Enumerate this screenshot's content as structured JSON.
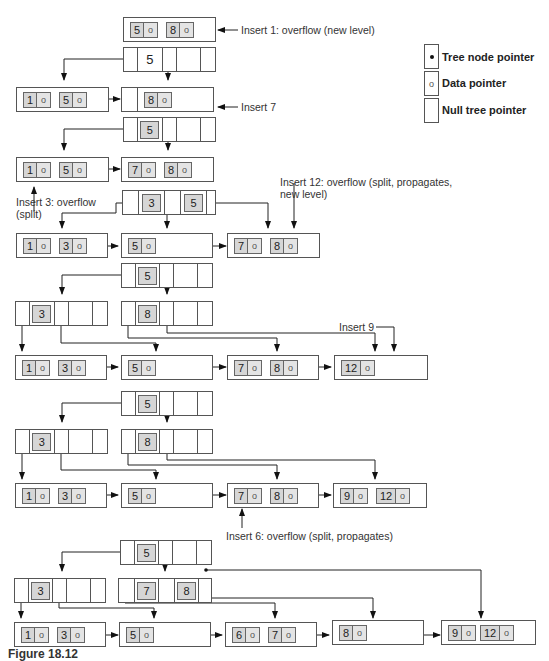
{
  "legend": {
    "items": [
      {
        "symbol": "•",
        "label": "Tree node pointer"
      },
      {
        "symbol": "o",
        "label": "Data pointer"
      },
      {
        "symbol": "",
        "label": "Null tree pointer"
      }
    ]
  },
  "annotations": {
    "insert1": "Insert 1: overflow (new level)",
    "insert7": "Insert 7",
    "insert3_line1": "Insert 3: overflow",
    "insert3_line2": "(split)",
    "insert12_line1": "Insert 12: overflow (split, propagates,",
    "insert12_line2": "new level)",
    "insert9": "Insert 9",
    "insert6": "Insert 6: overflow (split, propagates)"
  },
  "data_pointer_symbol": "o",
  "stages": {
    "s1": {
      "leaf": [
        "5",
        "8"
      ]
    },
    "s2": {
      "root": [
        "5"
      ],
      "leaves": [
        [
          "1",
          "5"
        ],
        [
          "8"
        ]
      ]
    },
    "s3": {
      "root": [
        "5"
      ],
      "leaves": [
        [
          "1",
          "5"
        ],
        [
          "7",
          "8"
        ]
      ]
    },
    "s4": {
      "root": [
        "3",
        "5"
      ],
      "leaves": [
        [
          "1",
          "3"
        ],
        [
          "5"
        ],
        [
          "7",
          "8"
        ]
      ]
    },
    "s5": {
      "root": [
        "5"
      ],
      "internal": [
        [
          "3"
        ],
        [
          "8"
        ]
      ],
      "leaves": [
        [
          "1",
          "3"
        ],
        [
          "5"
        ],
        [
          "7",
          "8"
        ],
        [
          "12"
        ]
      ]
    },
    "s6": {
      "root": [
        "5"
      ],
      "internal": [
        [
          "3"
        ],
        [
          "8"
        ]
      ],
      "leaves": [
        [
          "1",
          "3"
        ],
        [
          "5"
        ],
        [
          "7",
          "8"
        ],
        [
          "9",
          "12"
        ]
      ]
    },
    "s7": {
      "root": [
        "5"
      ],
      "internal": [
        [
          "3"
        ],
        [
          "7",
          "8"
        ]
      ],
      "leaves": [
        [
          "1",
          "3"
        ],
        [
          "5"
        ],
        [
          "6",
          "7"
        ],
        [
          "8"
        ],
        [
          "9",
          "12"
        ]
      ]
    }
  },
  "caption": "Figure 18.12"
}
